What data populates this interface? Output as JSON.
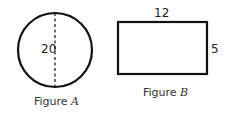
{
  "figure_a": {
    "shape": "circle",
    "diameter_label": "20",
    "caption_prefix": "Figure ",
    "caption_letter": "A"
  },
  "figure_b": {
    "shape": "rectangle",
    "width_label": "12",
    "height_label": "5",
    "caption_prefix": "Figure ",
    "caption_letter": "B"
  },
  "colors": {
    "stroke": "#111111",
    "text": "#222222"
  }
}
